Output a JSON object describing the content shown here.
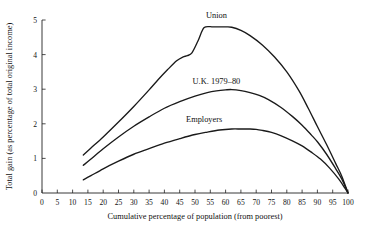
{
  "chart_data": {
    "type": "line",
    "title": "",
    "xlabel": "Cumulative percentage of population (from poorest)",
    "ylabel": "Total gain (as percentage of total original income)",
    "xlim": [
      0,
      100
    ],
    "ylim": [
      0,
      5
    ],
    "grid": false,
    "legend_position": "inline-annotations",
    "xticks": [
      0,
      5,
      10,
      15,
      20,
      25,
      30,
      35,
      40,
      45,
      50,
      55,
      60,
      65,
      70,
      75,
      80,
      85,
      90,
      95,
      100
    ],
    "xtick_labels": [
      "0",
      "5",
      "10",
      "15",
      "20",
      "25",
      "30",
      "35",
      "40",
      "45",
      "50",
      "55",
      "60",
      "65",
      "70",
      "75",
      "80",
      "85",
      "90",
      "95",
      "100"
    ],
    "yticks": [
      0,
      1,
      2,
      3,
      4,
      5
    ],
    "ytick_labels": [
      "0",
      "1",
      "2",
      "3",
      "4",
      "5"
    ],
    "series": [
      {
        "name": "Union",
        "label": "Union",
        "label_x": 57,
        "label_y": 5.05,
        "x": [
          13.5,
          16,
          20,
          25,
          30,
          35,
          38,
          41,
          44,
          46,
          47.5,
          49,
          51,
          53,
          56,
          60,
          62,
          65,
          68,
          72,
          76,
          80,
          84,
          87,
          90,
          93,
          96,
          98,
          100
        ],
        "y": [
          1.1,
          1.3,
          1.62,
          2.05,
          2.5,
          2.98,
          3.28,
          3.56,
          3.82,
          3.93,
          3.97,
          4.05,
          4.4,
          4.78,
          4.8,
          4.8,
          4.79,
          4.7,
          4.55,
          4.28,
          3.93,
          3.5,
          2.95,
          2.45,
          1.92,
          1.4,
          0.85,
          0.48,
          0.0
        ]
      },
      {
        "name": "U.K. 1979-80",
        "label": "U.K. 1979–80",
        "label_x": 57,
        "label_y": 3.14,
        "x": [
          13.5,
          16,
          20,
          25,
          30,
          35,
          40,
          45,
          50,
          54,
          57,
          60,
          62,
          65,
          68,
          71,
          74,
          78,
          82,
          85,
          88,
          90,
          93,
          96,
          98,
          100
        ],
        "y": [
          0.8,
          0.98,
          1.28,
          1.62,
          1.93,
          2.2,
          2.45,
          2.64,
          2.8,
          2.9,
          2.95,
          2.98,
          2.99,
          2.96,
          2.9,
          2.82,
          2.7,
          2.48,
          2.2,
          1.96,
          1.68,
          1.48,
          1.12,
          0.7,
          0.4,
          0.0
        ]
      },
      {
        "name": "Employers",
        "label": "Employers",
        "label_x": 53,
        "label_y": 2.06,
        "x": [
          13.5,
          16,
          20,
          25,
          30,
          35,
          40,
          45,
          50,
          54,
          58,
          62,
          65,
          68,
          70,
          72,
          75,
          78,
          82,
          85,
          88,
          91,
          94,
          97,
          99,
          100
        ],
        "y": [
          0.38,
          0.5,
          0.7,
          0.92,
          1.12,
          1.28,
          1.44,
          1.57,
          1.69,
          1.76,
          1.82,
          1.85,
          1.85,
          1.85,
          1.84,
          1.81,
          1.75,
          1.66,
          1.5,
          1.36,
          1.18,
          0.98,
          0.72,
          0.4,
          0.14,
          0.0
        ]
      }
    ]
  }
}
